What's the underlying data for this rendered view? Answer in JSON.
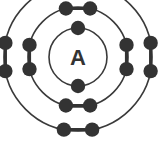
{
  "diagram": {
    "type": "bohr-atomic-model",
    "nucleus": {
      "label": "A",
      "label_font_size": 22,
      "center_x": 78,
      "center_y": 57
    },
    "colors": {
      "ink": "#333333",
      "electron": "#333333",
      "ring": "#3a3a3a",
      "background": "#ffffff"
    },
    "ring_stroke_width": 1.6,
    "electron_radius": 7.2,
    "electron_link_width": 3.2,
    "shells": [
      {
        "name": "shell-1",
        "label": "inner shell",
        "radius": 29,
        "electron_count": 2,
        "electron_angles": [
          270,
          90
        ]
      },
      {
        "name": "shell-2",
        "label": "middle shell",
        "radius": 50,
        "electron_count": 8,
        "electron_angles": [
          256,
          284,
          76,
          104,
          166,
          194,
          346,
          14
        ]
      },
      {
        "name": "shell-3",
        "label": "outer shell",
        "radius": 74,
        "electron_count": 8,
        "electron_angles": [
          259,
          281,
          79,
          101,
          169,
          191,
          349,
          11
        ]
      }
    ]
  }
}
